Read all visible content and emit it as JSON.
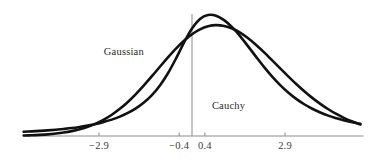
{
  "chart_data": {
    "type": "line",
    "title": "",
    "subtitle": "",
    "xlabel": "",
    "ylabel": "",
    "grid": false,
    "legend_position": "inline-annotation",
    "xlim": [
      -5.25,
      5.35
    ],
    "ylim": [
      0,
      1.0
    ],
    "x_ticks": [
      -2.9,
      -0.4,
      0.4,
      2.9
    ],
    "x_tick_labels": [
      "−2.9",
      "−0.4",
      "0.4",
      "2.9"
    ],
    "y_ticks": [],
    "y_tick_labels": [],
    "vertical_axis_at_x": 0,
    "annotations": [
      {
        "name": "gaussian-label",
        "text": "Gaussian",
        "x": -2.75,
        "y": 0.63
      },
      {
        "name": "cauchy-label",
        "text": "Cauchy",
        "x": 0.62,
        "y": 0.21
      }
    ],
    "series": [
      {
        "name": "Gaussian",
        "label": "Gaussian",
        "color": "#111111",
        "peak_value": 0.88,
        "x": [
          -5.25,
          -5.0,
          -4.75,
          -4.5,
          -4.25,
          -4.0,
          -3.75,
          -3.5,
          -3.25,
          -3.0,
          -2.75,
          -2.5,
          -2.25,
          -2.0,
          -1.75,
          -1.5,
          -1.25,
          -1.0,
          -0.75,
          -0.5,
          -0.25,
          0,
          0.25,
          0.5,
          0.75,
          1.0,
          1.25,
          1.5,
          1.75,
          2.0,
          2.25,
          2.5,
          2.75,
          3.0,
          3.25,
          3.5,
          3.75,
          4.0,
          4.25,
          4.5,
          4.75,
          5.0,
          5.25
        ],
        "values": [
          0.004,
          0.006,
          0.009,
          0.013,
          0.019,
          0.027,
          0.038,
          0.053,
          0.072,
          0.097,
          0.128,
          0.166,
          0.212,
          0.266,
          0.327,
          0.395,
          0.467,
          0.541,
          0.614,
          0.683,
          0.744,
          0.795,
          0.833,
          0.857,
          0.866,
          0.86,
          0.84,
          0.807,
          0.763,
          0.711,
          0.653,
          0.591,
          0.528,
          0.466,
          0.406,
          0.35,
          0.298,
          0.251,
          0.209,
          0.172,
          0.14,
          0.113,
          0.09
        ]
      },
      {
        "name": "Cauchy",
        "label": "Cauchy",
        "color": "#111111",
        "peak_value": 1.0,
        "x": [
          -5.25,
          -5.0,
          -4.75,
          -4.5,
          -4.25,
          -4.0,
          -3.75,
          -3.5,
          -3.25,
          -3.0,
          -2.75,
          -2.5,
          -2.25,
          -2.0,
          -1.75,
          -1.5,
          -1.25,
          -1.0,
          -0.75,
          -0.5,
          -0.25,
          0,
          0.25,
          0.5,
          0.75,
          1.0,
          1.25,
          1.5,
          1.75,
          2.0,
          2.25,
          2.5,
          2.75,
          3.0,
          3.25,
          3.5,
          3.75,
          4.0,
          4.25,
          4.5,
          4.75,
          5.0,
          5.25
        ],
        "values": [
          0.033,
          0.036,
          0.04,
          0.044,
          0.049,
          0.055,
          0.062,
          0.071,
          0.081,
          0.094,
          0.11,
          0.128,
          0.151,
          0.18,
          0.216,
          0.262,
          0.32,
          0.395,
          0.49,
          0.605,
          0.73,
          0.84,
          0.915,
          0.945,
          0.94,
          0.905,
          0.85,
          0.78,
          0.7,
          0.618,
          0.538,
          0.464,
          0.398,
          0.34,
          0.29,
          0.248,
          0.213,
          0.184,
          0.159,
          0.139,
          0.121,
          0.107,
          0.095
        ]
      }
    ]
  }
}
